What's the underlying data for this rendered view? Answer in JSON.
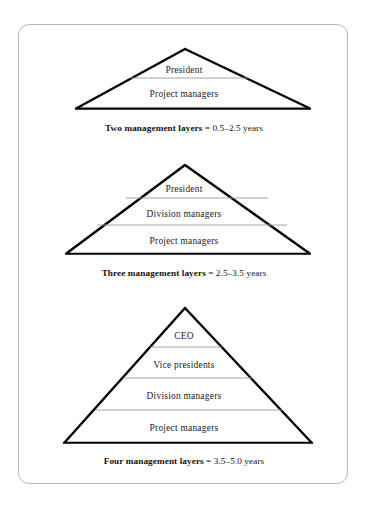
{
  "figure": {
    "background_color": "#ffffff",
    "frame_border_color": "#b9b9b9",
    "outline_color": "#000000",
    "divider_color": "#9a9a9a",
    "pyramids": [
      {
        "id": "two-layer-pyramid",
        "tiers": [
          "President",
          "Project managers"
        ],
        "caption_title": "Two management layers",
        "caption_value": "= 0.5–2.5 years"
      },
      {
        "id": "three-layer-pyramid",
        "tiers": [
          "President",
          "Division managers",
          "Project managers"
        ],
        "caption_title": "Three management layers",
        "caption_value": "= 2.5–3.5 years"
      },
      {
        "id": "four-layer-pyramid",
        "tiers": [
          "CEO",
          "Vice presidents",
          "Division managers",
          "Project managers"
        ],
        "caption_title": "Four management layers",
        "caption_value": "= 3.5–5.0 years"
      }
    ]
  }
}
